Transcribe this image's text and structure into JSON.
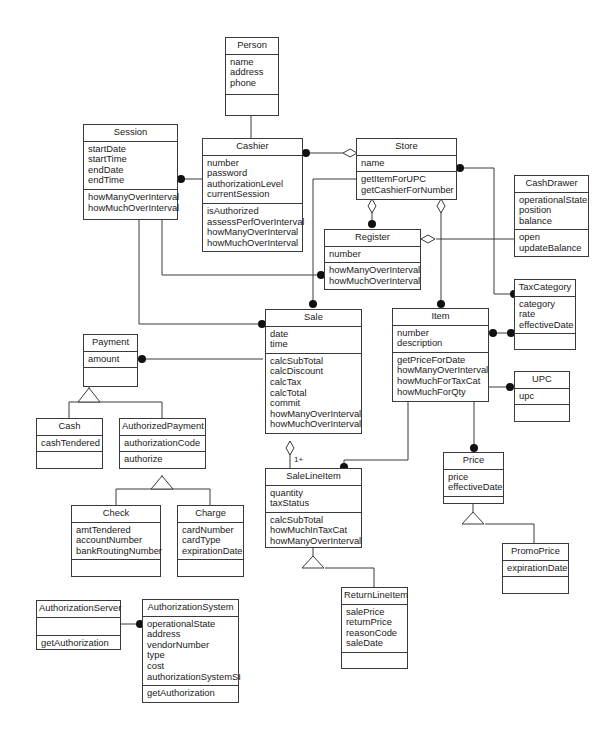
{
  "diagram": {
    "type": "UML class diagram",
    "classes": {
      "person": {
        "name": "Person",
        "attributes": [
          "name",
          "address",
          "phone"
        ],
        "operations": []
      },
      "session": {
        "name": "Session",
        "attributes": [
          "startDate",
          "startTime",
          "endDate",
          "endTime"
        ],
        "operations": [
          "howManyOverInterval",
          "howMuchOverInterval"
        ]
      },
      "cashier": {
        "name": "Cashier",
        "attributes": [
          "number",
          "password",
          "authorizationLevel",
          "currentSession"
        ],
        "operations": [
          "isAuthorized",
          "assessPerfOverInterval",
          "howManyOverInterval",
          "howMuchOverInterval"
        ]
      },
      "store": {
        "name": "Store",
        "attributes": [
          "name"
        ],
        "operations": [
          "getItemForUPC",
          "getCashierForNumber"
        ]
      },
      "cashdrawer": {
        "name": "CashDrawer",
        "attributes": [
          "operationalState",
          "position",
          "balance"
        ],
        "operations": [
          "open",
          "updateBalance"
        ]
      },
      "register": {
        "name": "Register",
        "attributes": [
          "number"
        ],
        "operations": [
          "howManyOverInterval",
          "howMuchOverInterval"
        ]
      },
      "taxcategory": {
        "name": "TaxCategory",
        "attributes": [
          "category",
          "rate",
          "effectiveDate"
        ],
        "operations": []
      },
      "payment": {
        "name": "Payment",
        "attributes": [
          "amount"
        ],
        "operations": []
      },
      "sale": {
        "name": "Sale",
        "attributes": [
          "date",
          "time"
        ],
        "operations": [
          "calcSubTotal",
          "calcDiscount",
          "calcTax",
          "calcTotal",
          "commit",
          "howManyOverInterval",
          "howMuchOverInterval"
        ]
      },
      "item": {
        "name": "Item",
        "attributes": [
          "number",
          "description"
        ],
        "operations": [
          "getPriceForDate",
          "howManyOverInterval",
          "howMuchForTaxCat",
          "howMuchForQty"
        ]
      },
      "upc": {
        "name": "UPC",
        "attributes": [
          "upc"
        ],
        "operations": []
      },
      "cash": {
        "name": "Cash",
        "attributes": [
          "cashTendered"
        ],
        "operations": []
      },
      "authorizedpayment": {
        "name": "AuthorizedPayment",
        "attributes": [
          "authorizationCode"
        ],
        "operations": [
          "authorize"
        ]
      },
      "salelineitem": {
        "name": "SaleLineItem",
        "attributes": [
          "quantity",
          "taxStatus"
        ],
        "operations": [
          "calcSubTotal",
          "howMuchInTaxCat",
          "howManyOverInterval"
        ]
      },
      "price": {
        "name": "Price",
        "attributes": [
          "price",
          "effectiveDate"
        ],
        "operations": []
      },
      "check": {
        "name": "Check",
        "attributes": [
          "amtTendered",
          "accountNumber",
          "bankRoutingNumber"
        ],
        "operations": []
      },
      "charge": {
        "name": "Charge",
        "attributes": [
          "cardNumber",
          "cardType",
          "expirationDate"
        ],
        "operations": []
      },
      "promoprice": {
        "name": "PromoPrice",
        "attributes": [
          "expirationDate"
        ],
        "operations": []
      },
      "returnlineitem": {
        "name": "ReturnLineItem",
        "attributes": [
          "salePrice",
          "returnPrice",
          "reasonCode",
          "saleDate"
        ],
        "operations": []
      },
      "authorizationserver": {
        "name": "AuthorizationServer",
        "attributes": [],
        "operations": [
          "getAuthorization"
        ]
      },
      "authorizationsystem": {
        "name": "AuthorizationSystem",
        "attributes": [
          "operationalState",
          "address",
          "vendorNumber",
          "type",
          "cost",
          "authorizationSystemSI"
        ],
        "operations": [
          "getAuthorization"
        ]
      }
    },
    "multiplicities": {
      "sale_salelineitem": "1+"
    },
    "generalizations": [
      {
        "parent": "Payment",
        "children": [
          "Cash",
          "AuthorizedPayment"
        ]
      },
      {
        "parent": "AuthorizedPayment",
        "children": [
          "Check",
          "Charge"
        ]
      },
      {
        "parent": "SaleLineItem",
        "children": [
          "ReturnLineItem"
        ]
      },
      {
        "parent": "Price",
        "children": [
          "PromoPrice"
        ]
      }
    ],
    "associations": [
      {
        "from": "Person",
        "to": "Cashier",
        "kind": "generalization-line"
      },
      {
        "from": "Cashier",
        "to": "Session",
        "kind": "association-many"
      },
      {
        "from": "Store",
        "to": "Cashier",
        "kind": "aggregation-many"
      },
      {
        "from": "Store",
        "to": "Register",
        "kind": "aggregation-many"
      },
      {
        "from": "Store",
        "to": "Item",
        "kind": "aggregation-many"
      },
      {
        "from": "Store",
        "to": "TaxCategory",
        "kind": "association-many"
      },
      {
        "from": "Store",
        "to": "Sale",
        "kind": "association-many"
      },
      {
        "from": "Register",
        "to": "CashDrawer",
        "kind": "aggregation"
      },
      {
        "from": "Session",
        "to": "Register",
        "kind": "association-many"
      },
      {
        "from": "Session",
        "to": "Sale",
        "kind": "association-many"
      },
      {
        "from": "Sale",
        "to": "Payment",
        "kind": "association-many"
      },
      {
        "from": "Sale",
        "to": "SaleLineItem",
        "kind": "aggregation",
        "multiplicity": "1+"
      },
      {
        "from": "Item",
        "to": "SaleLineItem",
        "kind": "association-many"
      },
      {
        "from": "Item",
        "to": "TaxCategory",
        "kind": "many-to-many"
      },
      {
        "from": "Item",
        "to": "UPC",
        "kind": "association-many"
      },
      {
        "from": "Item",
        "to": "Price",
        "kind": "association-many"
      },
      {
        "from": "AuthorizationServer",
        "to": "AuthorizationSystem",
        "kind": "association-many"
      }
    ]
  }
}
